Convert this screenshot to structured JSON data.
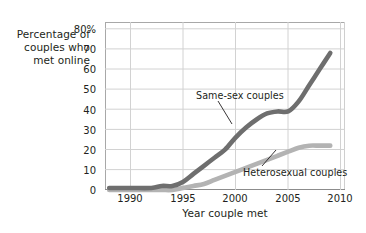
{
  "chart_data": {
    "type": "line",
    "title": "",
    "ylabel": "Percentage of couples who met online",
    "ylabel_lines": [
      "Percentage of",
      "couples who",
      "met online"
    ],
    "xlabel": "Year couple met",
    "xlim": [
      1987.6,
      2010.4
    ],
    "ylim": [
      0,
      80
    ],
    "yticks": [
      0,
      10,
      20,
      30,
      40,
      50,
      60,
      70,
      80
    ],
    "ytick_labels": [
      "0",
      "10",
      "20",
      "30",
      "40",
      "50",
      "60",
      "70",
      "80%"
    ],
    "xticks": [
      1990,
      1995,
      2000,
      2005,
      2010
    ],
    "xtick_labels": [
      "1990",
      "1995",
      "2000",
      "2005",
      "2010"
    ],
    "grid": "both",
    "legend": "annotations",
    "series": [
      {
        "name": "Same-sex couples",
        "color": "#6e6e6e",
        "label_position": "above-left-of-curve",
        "x": [
          1988,
          1990,
          1992,
          1993,
          1994,
          1995,
          1996,
          1997,
          1998,
          1999,
          2000,
          2001,
          2002,
          2003,
          2004,
          2005,
          2006,
          2007,
          2008,
          2009
        ],
        "y": [
          1,
          1,
          1,
          2,
          2,
          4,
          8,
          12,
          16,
          20,
          26,
          31,
          35,
          38,
          39,
          39,
          44,
          52,
          60,
          68
        ]
      },
      {
        "name": "Heterosexual couples",
        "color": "#b3b3b3",
        "label_position": "below-right-of-curve",
        "x": [
          1988,
          1990,
          1992,
          1993,
          1994,
          1995,
          1996,
          1997,
          1998,
          1999,
          2000,
          2001,
          2002,
          2003,
          2004,
          2005,
          2006,
          2007,
          2008,
          2009
        ],
        "y": [
          0,
          0,
          0,
          0,
          0,
          1,
          2,
          3,
          5,
          7,
          9,
          11,
          13,
          15,
          17,
          19,
          21,
          22,
          22,
          22
        ]
      }
    ],
    "annotations": [
      {
        "text": "Same-sex couples",
        "target_x": 2000.5,
        "target_y": 38
      },
      {
        "text": "Heterosexual couples",
        "target_x": 2006.0,
        "target_y": 22
      }
    ],
    "colors": {
      "same_sex": "#6e6e6e",
      "heterosexual": "#b3b3b3",
      "grid": "#cfcfcf",
      "axis": "#9a9a9a",
      "text": "#231f20",
      "background": "#ffffff"
    }
  }
}
